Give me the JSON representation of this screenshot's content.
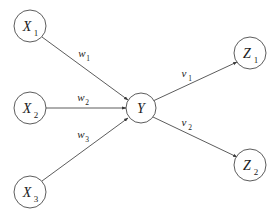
{
  "figure": {
    "type": "neural-network-diagram",
    "background_color": "#ffffff",
    "stroke_color": "#4a4a4a",
    "text_color": "#1b1b1b",
    "width": 280,
    "height": 221
  },
  "nodes": [
    {
      "id": "x1",
      "base": "X",
      "subscript": "1",
      "cx": 30,
      "cy": 26,
      "r": 16,
      "role": "input"
    },
    {
      "id": "x2",
      "base": "X",
      "subscript": "2",
      "cx": 30,
      "cy": 108,
      "r": 16,
      "role": "input"
    },
    {
      "id": "x3",
      "base": "X",
      "subscript": "3",
      "cx": 30,
      "cy": 192,
      "r": 16,
      "role": "input"
    },
    {
      "id": "y",
      "base": "Y",
      "subscript": "",
      "cx": 141,
      "cy": 108,
      "r": 15,
      "role": "hidden"
    },
    {
      "id": "z1",
      "base": "Z",
      "subscript": "1",
      "cx": 250,
      "cy": 53,
      "r": 16,
      "role": "output"
    },
    {
      "id": "z2",
      "base": "Z",
      "subscript": "2",
      "cx": 250,
      "cy": 165,
      "r": 16,
      "role": "output"
    }
  ],
  "edges": [
    {
      "id": "e-x1-y",
      "from": "x1",
      "to": "y",
      "label_base": "w",
      "label_subscript": "1",
      "label_x": 82,
      "label_y": 57,
      "x1": 42,
      "y1": 37,
      "x2": 128,
      "y2": 100
    },
    {
      "id": "e-x2-y",
      "from": "x2",
      "to": "y",
      "label_base": "w",
      "label_subscript": "2",
      "label_x": 81,
      "label_y": 101,
      "x1": 46,
      "y1": 108,
      "x2": 126,
      "y2": 108
    },
    {
      "id": "e-x3-y",
      "from": "x3",
      "to": "y",
      "label_base": "w",
      "label_subscript": "3",
      "label_x": 81,
      "label_y": 138,
      "x1": 42,
      "y1": 181,
      "x2": 128,
      "y2": 118
    },
    {
      "id": "e-y-z1",
      "from": "y",
      "to": "z1",
      "label_base": "v",
      "label_subscript": "1",
      "label_x": 184,
      "label_y": 77,
      "x1": 153,
      "y1": 101,
      "x2": 237,
      "y2": 62
    },
    {
      "id": "e-y-z2",
      "from": "y",
      "to": "z2",
      "label_base": "v",
      "label_subscript": "2",
      "label_x": 184,
      "label_y": 126,
      "x1": 153,
      "y1": 117,
      "x2": 237,
      "y2": 157
    }
  ]
}
